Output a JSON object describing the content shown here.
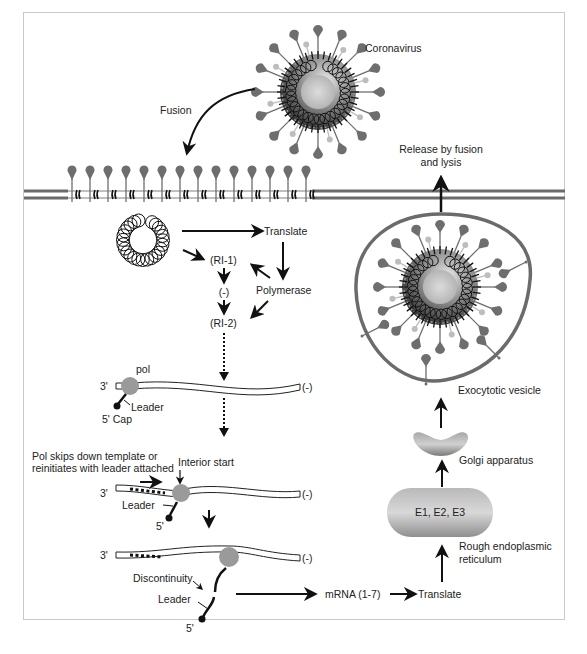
{
  "colors": {
    "membrane": "#6b6b6b",
    "spike": "#6e6e6e",
    "light_spike": "#bdbdbd",
    "polymerase": "#9a9a9a",
    "ink": "#111111"
  },
  "labels": {
    "coronavirus": "Coronavirus",
    "fusion": "Fusion",
    "release": [
      "Release by fusion",
      "and lysis"
    ],
    "translate_top": "Translate",
    "ri1": "(RI-1)",
    "minus_mid": "(-)",
    "polymerase": "Polymerase",
    "ri2": "(RI-2)",
    "pol": "pol",
    "three_prime": "3'",
    "minus_strand": "(-)",
    "leader": "Leader",
    "five_prime_cap": "5' Cap",
    "skip_note": [
      "Pol skips down template or",
      "reinitiates with leader attached"
    ],
    "interior_start": "Interior start",
    "five_prime": "5'",
    "discontinuity": "Discontinuity",
    "mrna": "mRNA (1-7)",
    "translate_bottom": "Translate",
    "exocytotic_vesicle": "Exocytotic vesicle",
    "golgi": "Golgi apparatus",
    "er_proteins": "E1, E2, E3",
    "rough_er": [
      "Rough endoplasmic",
      "reticulum"
    ]
  }
}
